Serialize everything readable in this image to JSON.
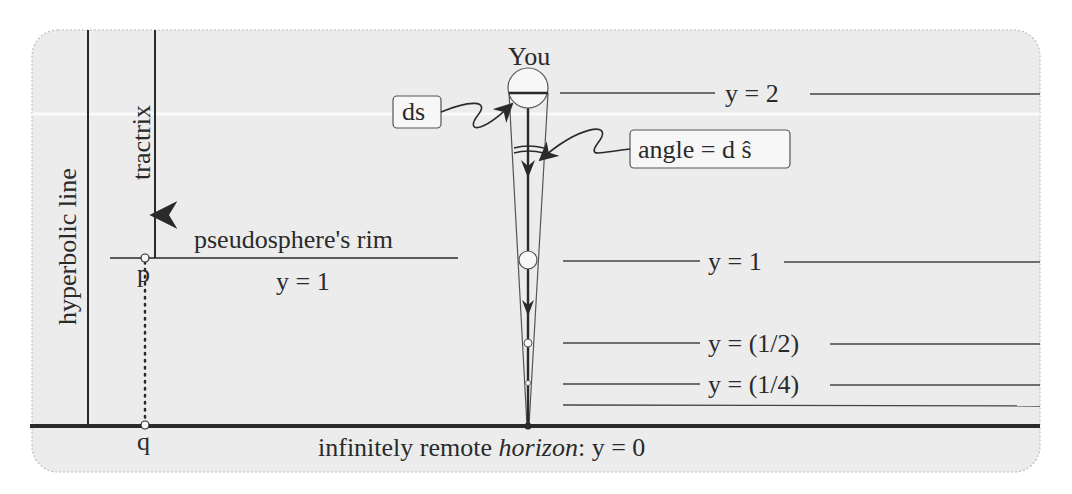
{
  "diagram": {
    "colors": {
      "panel_bg": "#ececec",
      "panel_border": "#bdbdbd",
      "ink": "#2a2a2a",
      "page_bg": "#ffffff",
      "marker_fill": "#f7f7f7"
    },
    "labels": {
      "you": "You",
      "hyperbolic_line": "hyperbolic  line",
      "tractrix": "tractrix",
      "rim_title": "pseudosphere's  rim",
      "rim_value": "y = 1",
      "point_p": "p",
      "point_q": "q",
      "ds_callout": "ds",
      "angle_callout": "angle = d ŝ",
      "horizon_prefix": "infinitely remote ",
      "horizon_italic": "horizon",
      "horizon_suffix": ":  y = 0"
    },
    "levels": [
      {
        "name": "level-y-2",
        "label": "y = 2",
        "y_value": 2
      },
      {
        "name": "level-y-1",
        "label": "y = 1",
        "y_value": 1
      },
      {
        "name": "level-y-half",
        "label": "y = (1/2)",
        "y_value": 0.5
      },
      {
        "name": "level-y-quarter",
        "label": "y = (1/4)",
        "y_value": 0.25
      }
    ]
  }
}
